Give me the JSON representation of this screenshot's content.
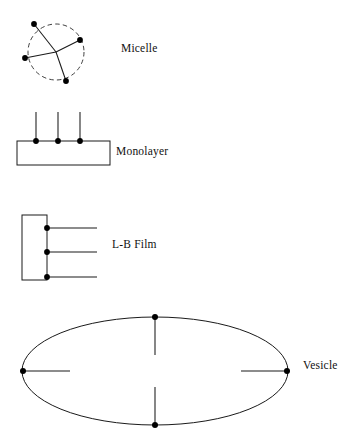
{
  "figure": {
    "background_color": "#ffffff",
    "stroke_color": "#1a1a1a",
    "headgroup_color": "#000000",
    "width": 354,
    "height": 438
  },
  "structures": [
    {
      "id": "micelle",
      "label": "Micelle",
      "shape": "dashed-circle",
      "center": [
        56,
        52
      ],
      "radius": 28,
      "tail_count": 4,
      "headgroups": [
        [
          34,
          24
        ],
        [
          80,
          40
        ],
        [
          25,
          58
        ],
        [
          66,
          81
        ]
      ],
      "description": "Dashed circular boundary with four amphiphile tails radiating outward from the core to headgroup dots on the perimeter."
    },
    {
      "id": "monolayer",
      "label": "Monolayer",
      "shape": "rectangle",
      "rect": [
        17,
        141,
        93,
        24
      ],
      "tail_count": 3,
      "headgroups": [
        [
          36,
          141
        ],
        [
          58,
          141
        ],
        [
          80,
          141
        ]
      ],
      "tail_length": 29,
      "tail_direction": "up",
      "description": "Horizontal rectangle with three vertical amphiphile tails rising from headgroup dots on the top edge."
    },
    {
      "id": "lb-film",
      "label": "L-B Film",
      "shape": "rectangle",
      "rect": [
        22,
        215,
        25,
        65
      ],
      "tail_count": 3,
      "headgroups": [
        [
          47,
          228
        ],
        [
          47,
          252
        ],
        [
          47,
          277
        ]
      ],
      "tail_length": 50,
      "tail_direction": "right",
      "description": "Vertical rectangle with three horizontal amphiphile tails extending right from headgroup dots on the right edge."
    },
    {
      "id": "vesicle",
      "label": "Vesicle",
      "shape": "ellipse",
      "center": [
        155,
        371
      ],
      "radius_x": 133,
      "radius_y": 54,
      "tail_count": 4,
      "headgroups": [
        [
          155,
          317
        ],
        [
          287,
          371
        ],
        [
          155,
          425
        ],
        [
          23,
          371
        ]
      ],
      "tail_length": 46,
      "tail_direction": "inward",
      "description": "Large ellipse with four amphiphile tails pointing inward from headgroup dots at the top, right, bottom and left extremes."
    }
  ],
  "labels": {
    "micelle": "Micelle",
    "monolayer": "Monolayer",
    "lb_film": "L-B Film",
    "vesicle": "Vesicle"
  }
}
